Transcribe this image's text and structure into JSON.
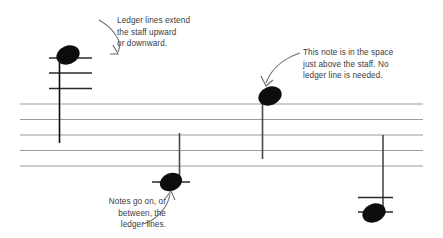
{
  "figure": {
    "background_color": "#ffffff",
    "width": 443,
    "height": 238
  },
  "staff": {
    "label": "five-line-staff",
    "line_count": 5,
    "line_color": "#9a9a9a",
    "line_ys": [
      104,
      119.5,
      135,
      150.5,
      166
    ],
    "x_start": 20,
    "x_end": 423
  },
  "notes": [
    {
      "name": "note-high-above-staff",
      "head_cx": 68,
      "head_cy": 55,
      "stem_x": 59.5,
      "stem_y1": 56,
      "stem_y2": 143,
      "stem_direction": "down",
      "ledger_line_ys": [
        58,
        73,
        88.5
      ],
      "ledger_x1": 49,
      "ledger_x2": 92,
      "color": "#0d0d0d"
    },
    {
      "name": "note-space-above-staff",
      "head_cx": 270,
      "head_cy": 96,
      "stem_x": 262.5,
      "stem_y1": 97,
      "stem_y2": 159,
      "stem_direction": "down",
      "ledger_line_ys": [],
      "ledger_x1": 0,
      "ledger_x2": 0,
      "color": "#0d0d0d"
    },
    {
      "name": "note-on-first-ledger-below",
      "head_cx": 171,
      "head_cy": 182,
      "stem_x": 179.5,
      "stem_y1": 181,
      "stem_y2": 133,
      "stem_direction": "up",
      "ledger_line_ys": [
        182
      ],
      "ledger_x1": 152,
      "ledger_x2": 190,
      "color": "#0d0d0d"
    },
    {
      "name": "note-on-second-ledger-below",
      "head_cx": 374,
      "head_cy": 213,
      "stem_x": 383,
      "stem_y1": 212,
      "stem_y2": 135,
      "stem_direction": "up",
      "ledger_line_ys": [
        197.5,
        212
      ],
      "ledger_x1": 358,
      "ledger_x2": 393,
      "color": "#0d0d0d"
    }
  ],
  "callouts": [
    {
      "name": "ledger-lines-extend-callout",
      "text": "Ledger lines extend\nthe staff upward\nor downward.",
      "align": "left",
      "color": "#3b3b3b"
    },
    {
      "name": "note-in-space-callout",
      "text": "This note is in the space\njust above the staff. No\nledger line is needed.",
      "align": "left",
      "color": "#3b3b3b"
    },
    {
      "name": "notes-on-or-between-callout",
      "text": "Notes go on, or\nbetween, the\nledger lines.",
      "align": "right",
      "color": "#3b3b3b"
    }
  ],
  "arrows": [
    {
      "name": "arrow-to-high-note",
      "from": "ledger-lines-extend-callout",
      "to": "note-high-above-staff",
      "color": "#6e6e6e"
    },
    {
      "name": "arrow-to-space-note",
      "from": "note-in-space-callout",
      "to": "note-space-above-staff",
      "color": "#6e6e6e"
    },
    {
      "name": "arrow-to-ledger-note",
      "from": "notes-on-or-between-callout",
      "to": "note-on-first-ledger-below",
      "color": "#6e6e6e"
    }
  ],
  "colors": {
    "staff_line": "#9a9a9a",
    "note": "#0d0d0d",
    "ledger_line": "#2a2a2a",
    "arrow": "#6e6e6e",
    "text": "#3b3b3b",
    "background": "#ffffff"
  }
}
